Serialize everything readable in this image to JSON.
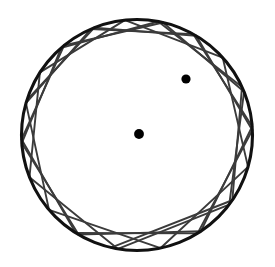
{
  "figure": {
    "type": "geometric-diagram",
    "canvas": {
      "width": 275,
      "height": 267,
      "background": "#ffffff"
    },
    "colors": {
      "boundary": "#111111",
      "chord": "#3b3b3b",
      "point": "#000000",
      "background": "#ffffff"
    }
  },
  "boundary_circle": {
    "label": "outer-circle",
    "cx": 137,
    "cy": 135,
    "r": 115.5,
    "stroke_width": 3.1,
    "stroke": "#111111",
    "fill": "none"
  },
  "focal_points": [
    {
      "label": "focus-upper-right",
      "cx": 186,
      "cy": 79,
      "r": 4.6,
      "fill": "#000000"
    },
    {
      "label": "focus-lower-left",
      "cx": 139,
      "cy": 134,
      "r": 4.9,
      "fill": "#000000"
    }
  ],
  "caustic": {
    "label": "inner-ellipse-envelope",
    "cx": 163,
    "cy": 107,
    "rx": 69,
    "ry": 52,
    "rotation_deg": -24,
    "visible_as_envelope": true
  },
  "chords": {
    "label": "billiard-chords",
    "count": 30,
    "stroke": "#3b3b3b",
    "stroke_width": 1.9,
    "description": "Chords of the outer circle, each tangent to the inner caustic ellipse, generated by repeated reflection.",
    "endpoints_deg": [
      [
        103.0,
        34.4
      ],
      [
        34.4,
        -24.6
      ],
      [
        -24.6,
        -79.4
      ],
      [
        -79.4,
        -131.0
      ],
      [
        -131.0,
        176.0
      ],
      [
        176.0,
        120.4
      ],
      [
        120.4,
        56.5
      ],
      [
        56.5,
        -4.2
      ],
      [
        -4.2,
        -60.9
      ],
      [
        -60.9,
        -113.4
      ],
      [
        -113.4,
        -164.0
      ],
      [
        -164.0,
        139.6
      ],
      [
        139.6,
        78.2
      ],
      [
        78.2,
        16.0
      ],
      [
        16.0,
        -42.1
      ],
      [
        -42.1,
        -96.0
      ],
      [
        -96.0,
        -147.2
      ],
      [
        -147.2,
        158.6
      ],
      [
        158.6,
        99.5
      ],
      [
        99.5,
        37.0
      ],
      [
        37.0,
        -22.0
      ],
      [
        -22.0,
        -77.0
      ],
      [
        -77.0,
        -129.2
      ],
      [
        -129.2,
        177.8
      ],
      [
        177.8,
        122.0
      ],
      [
        122.0,
        58.4
      ],
      [
        58.4,
        -2.4
      ],
      [
        -2.4,
        -59.2
      ],
      [
        -59.2,
        -111.8
      ],
      [
        -111.8,
        -162.5
      ]
    ]
  }
}
